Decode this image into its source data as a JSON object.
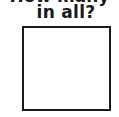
{
  "question": {
    "partial_line_above": "How many",
    "line": "in all?"
  },
  "answer_box": {
    "value": ""
  }
}
